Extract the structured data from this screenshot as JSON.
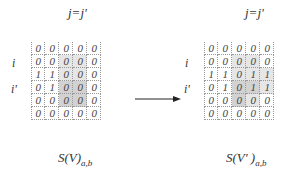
{
  "left": {
    "title": "j=j'",
    "row_labels": [
      {
        "row": 1,
        "label": "i"
      },
      {
        "row": 3,
        "label": "i'"
      }
    ],
    "matrix": [
      [
        "0",
        "0",
        "0",
        "0",
        "0"
      ],
      [
        "0",
        "0",
        "0",
        "0",
        "0"
      ],
      [
        "1",
        "1",
        "0",
        "0",
        "0"
      ],
      [
        "0",
        "1",
        "0",
        "0",
        "0"
      ],
      [
        "0",
        "0",
        "0",
        "0",
        "0"
      ],
      [
        "0",
        "0",
        "0",
        "0",
        "0"
      ]
    ],
    "subtitle_main": "S(V)",
    "subtitle_sub": "a,b"
  },
  "right": {
    "title": "j=j'",
    "row_labels": [
      {
        "row": 1,
        "label": "i"
      },
      {
        "row": 3,
        "label": "i'"
      }
    ],
    "matrix": [
      [
        "0",
        "0",
        "0",
        "0",
        "0"
      ],
      [
        "0",
        "0",
        "0",
        "0",
        "0"
      ],
      [
        "1",
        "1",
        "0",
        "1",
        "1"
      ],
      [
        "0",
        "1",
        "0",
        "1",
        "1"
      ],
      [
        "0",
        "0",
        "0",
        "0",
        "0"
      ],
      [
        "0",
        "0",
        "0",
        "0",
        "0"
      ]
    ],
    "subtitle_main": "S(V' )",
    "subtitle_sub": "a,b"
  },
  "arrow": {
    "direction": "right",
    "meaning": "transforms-to"
  },
  "colors": {
    "shade_light": "#e6e6e6",
    "shade_dark": "#d2d2d2",
    "grid_line": "#999999"
  }
}
